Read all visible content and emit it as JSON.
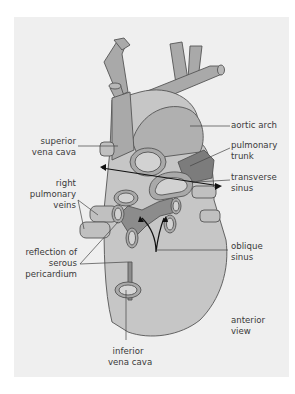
{
  "figure": {
    "background_color": "#efefef",
    "fill_light": "#c8c8c8",
    "fill_mid": "#a9a9a9",
    "fill_dark": "#8c8c8c",
    "stroke": "#555555"
  },
  "labels": {
    "aortic_arch": "aortic arch",
    "superior_vena_cava": [
      "superior",
      "vena cava"
    ],
    "pulmonary_trunk": [
      "pulmonary",
      "trunk"
    ],
    "transverse_sinus": [
      "transverse",
      "sinus"
    ],
    "right_pulmonary_veins": [
      "right",
      "pulmonary",
      "veins"
    ],
    "oblique_sinus": [
      "oblique",
      "sinus"
    ],
    "reflection_of_serous_pericardium": [
      "reflection of",
      "serous",
      "pericardium"
    ],
    "anterior_view": [
      "anterior",
      "view"
    ],
    "inferior_vena_cava": [
      "inferior",
      "vena cava"
    ]
  }
}
